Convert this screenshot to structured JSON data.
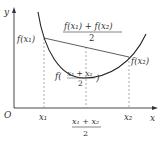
{
  "figure": {
    "colors": {
      "curve": "#222222",
      "axis": "#333333",
      "dashed": "#888888",
      "text": "#333333"
    },
    "axes": {
      "x_label": "x",
      "y_label": "y",
      "origin_label": "O"
    },
    "points": {
      "x1_label": "x₁",
      "x2_label": "x₂",
      "fx1_label": "f(x₁)",
      "fx2_label": "f(x₂)"
    },
    "midpoint": {
      "numerator": "x₁ + x₂",
      "denominator": "2",
      "f_prefix": "f(",
      "f_suffix": ")"
    },
    "chord_mid": {
      "numerator": "f(x₁) + f(x₂)",
      "denominator": "2"
    }
  }
}
